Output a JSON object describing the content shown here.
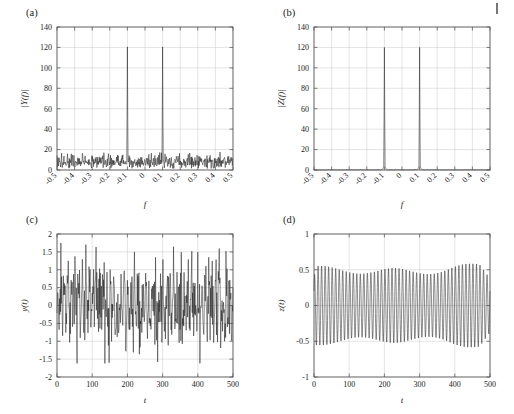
{
  "figure": {
    "background": "#ffffff",
    "curve_color": "#1a1a1a",
    "grid_color": "#c8c8c8",
    "axis_color": "#4d4d4d",
    "edge_mark_label": "page-edge-mark"
  },
  "chart_data": [
    {
      "id": "panel-a",
      "type": "line",
      "panel_label": "(a)",
      "title": "",
      "xlabel": "f",
      "ylabel": "|Y(f)|",
      "xlim": [
        -0.5,
        0.5
      ],
      "ylim": [
        0,
        140
      ],
      "xticks": [
        -0.5,
        -0.4,
        -0.3,
        -0.2,
        -0.1,
        0,
        0.1,
        0.2,
        0.3,
        0.4,
        0.5
      ],
      "xticklabels": [
        "-0.5",
        "-0.4",
        "-0.3",
        "-0.2",
        "-0.1",
        "0",
        "0.1",
        "0.2",
        "0.3",
        "0.4",
        "0.5"
      ],
      "yticks": [
        0,
        20,
        40,
        60,
        80,
        100,
        120,
        140
      ],
      "yticklabels": [
        "0",
        "20",
        "40",
        "60",
        "80",
        "100",
        "120",
        "140"
      ],
      "xtick_rotation": 45,
      "grid": true,
      "description": "Magnitude spectrum of noisy signal: broadband noise floor with two sharp spectral peaks",
      "signal": {
        "kind": "spectrum_noisy",
        "n_points": 501,
        "noise_floor_mean": 8.0,
        "noise_floor_min": 1.5,
        "noise_floor_max": 19.0,
        "peaks": [
          {
            "f": -0.1,
            "amplitude": 120.5
          },
          {
            "f": 0.1,
            "amplitude": 120.5
          }
        ],
        "peak_half_width": 0.004,
        "peak_shoulder": 24.0,
        "seed": 20713
      }
    },
    {
      "id": "panel-b",
      "type": "line",
      "panel_label": "(b)",
      "title": "",
      "xlabel": "f",
      "ylabel": "|Z(f)|",
      "xlim": [
        -0.5,
        0.5
      ],
      "ylim": [
        0,
        140
      ],
      "xticks": [
        -0.5,
        -0.4,
        -0.3,
        -0.2,
        -0.1,
        0,
        0.1,
        0.2,
        0.3,
        0.4,
        0.5
      ],
      "xticklabels": [
        "-0.5",
        "-0.4",
        "-0.3",
        "-0.2",
        "-0.1",
        "0",
        "0.1",
        "0.2",
        "0.3",
        "0.4",
        "0.5"
      ],
      "yticks": [
        0,
        20,
        40,
        60,
        80,
        100,
        120,
        140
      ],
      "yticklabels": [
        "0",
        "20",
        "40",
        "60",
        "80",
        "100",
        "120",
        "140"
      ],
      "xtick_rotation": 45,
      "grid": true,
      "description": "Magnitude spectrum of filtered signal: flat near-zero baseline with two narrow spectral peaks",
      "signal": {
        "kind": "spectrum_clean",
        "n_points": 501,
        "noise_floor_mean": 0.35,
        "noise_floor_min": 0.0,
        "noise_floor_max": 1.0,
        "peaks": [
          {
            "f": -0.1,
            "amplitude": 120.0
          },
          {
            "f": 0.1,
            "amplitude": 120.0
          }
        ],
        "peak_half_width": 0.006,
        "peak_skirt": 9.0,
        "seed": 40829
      }
    },
    {
      "id": "panel-c",
      "type": "line",
      "panel_label": "(c)",
      "title": "",
      "xlabel": "t",
      "ylabel": "y(t)",
      "xlim": [
        0,
        500
      ],
      "ylim": [
        -2,
        2
      ],
      "xticks": [
        0,
        100,
        200,
        300,
        400,
        500
      ],
      "xticklabels": [
        "0",
        "100",
        "200",
        "300",
        "400",
        "500"
      ],
      "yticks": [
        -2,
        -1.5,
        -1,
        -0.5,
        0,
        0.5,
        1,
        1.5,
        2
      ],
      "yticklabels": [
        "-2",
        "-1.5",
        "-1",
        "-0.5",
        "0",
        "0.5",
        "1",
        "1.5",
        "2"
      ],
      "xtick_rotation": 0,
      "grid": true,
      "description": "Noisy time-domain signal: sinusoid of frequency 0.1 buried in broadband noise",
      "signal": {
        "kind": "time_noisy",
        "n_points": 501,
        "t_start": 0,
        "t_end": 500,
        "carrier_frequency": 0.1,
        "carrier_amplitude": 0.48,
        "noise_amplitude": 0.52,
        "observed_min": -1.62,
        "observed_max": 1.75,
        "seed": 917
      }
    },
    {
      "id": "panel-d",
      "type": "line",
      "panel_label": "(d)",
      "title": "",
      "xlabel": "t",
      "ylabel": "z(t)",
      "xlim": [
        0,
        500
      ],
      "ylim": [
        -1,
        1
      ],
      "xticks": [
        0,
        100,
        200,
        300,
        400,
        500
      ],
      "xticklabels": [
        "0",
        "100",
        "200",
        "300",
        "400",
        "500"
      ],
      "yticks": [
        -1,
        -0.5,
        0,
        0.5,
        1
      ],
      "yticklabels": [
        "-1",
        "-0.5",
        "0",
        "0.5",
        "1"
      ],
      "xtick_rotation": 0,
      "grid": true,
      "description": "Filtered time-domain signal: clean amplitude-modulated sinusoid of frequency 0.1",
      "signal": {
        "kind": "time_clean",
        "n_points": 2001,
        "t_start": 0,
        "t_end": 500,
        "carrier_frequency": 0.1,
        "carrier_amplitude": 0.47,
        "envelope_min": 0.4,
        "envelope_max": 0.6,
        "envelope_peak_t": 410,
        "envelope_dip_t": 285,
        "observed_min": -0.6,
        "observed_max": 0.6,
        "seed": 3361
      }
    }
  ]
}
